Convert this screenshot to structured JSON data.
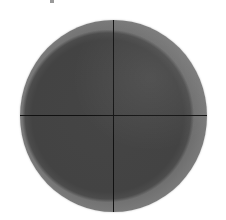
{
  "image": {
    "subject": "dark circular disk with crosshair lines",
    "colors": {
      "background": "#ffffff",
      "disk_interior": "#444444",
      "disk_rim": "#767676",
      "crosshair": "#111111",
      "fragment": "#9a9a9a"
    },
    "disk": {
      "center_x": 113,
      "center_y": 116,
      "width": 187,
      "height": 192
    },
    "crosshair": {
      "vertical_x": 113,
      "horizontal_y": 115
    },
    "caption": ""
  }
}
